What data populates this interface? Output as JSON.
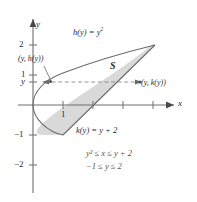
{
  "figure": {
    "name": "region-between-parabola-and-line",
    "axes": {
      "x_label": "x",
      "y_label": "y",
      "origin_px": [
        33,
        105
      ],
      "unit_px": 30,
      "x_ticks": [
        {
          "value": 1,
          "label": "1",
          "label_below": true
        },
        {
          "value": 2,
          "label": ""
        },
        {
          "value": 3,
          "label": ""
        },
        {
          "value": 4,
          "label": ""
        }
      ],
      "y_ticks": [
        {
          "value": 2,
          "label": "2"
        },
        {
          "value": 1,
          "label": "1"
        },
        {
          "value": -1,
          "label": "−1"
        },
        {
          "value": -2,
          "label": "−2"
        }
      ],
      "y_generic_tick_label": "y",
      "y_generic_tick_value": 0.77,
      "xlim": [
        -0.6,
        5.2
      ],
      "ylim": [
        -2.6,
        2.9
      ]
    },
    "curves": [
      {
        "name": "parabola-left-boundary",
        "equation_label": "h(y) = y",
        "equation_exponent": "2",
        "relation": "x = y^2",
        "y_range": [
          -1,
          2
        ]
      },
      {
        "name": "line-right-boundary",
        "equation_label": "k(y) = y + 2",
        "relation": "x = y + 2",
        "y_range": [
          -1,
          2
        ]
      }
    ],
    "region": {
      "name": "shaded-region-S",
      "label": "S",
      "fill_color": "#d9d9d9",
      "stroke_color": "#6b6b6b"
    },
    "points": [
      {
        "name": "point-on-parabola",
        "label": "(y, h(y))",
        "at": [
          0.6,
          0.77
        ]
      },
      {
        "name": "point-on-line",
        "label": "(y, k(y))",
        "at": [
          2.77,
          0.77
        ]
      }
    ],
    "dashed_segment": {
      "name": "horizontal-slice",
      "y": 0.77,
      "x_from": 0.6,
      "x_to": 2.77
    },
    "annotations": [
      {
        "name": "inequality-x",
        "text": "y² ≤ x ≤ y + 2"
      },
      {
        "name": "inequality-y",
        "text": "−1 ≤ y ≤ 2"
      }
    ],
    "colors": {
      "axis": "#6e6e6e",
      "curve": "#6b6b6b",
      "fill": "#d9d9d9",
      "text": "#2b2b2b",
      "annotation_text": "#545454",
      "dash": "#8a8a8a"
    }
  }
}
